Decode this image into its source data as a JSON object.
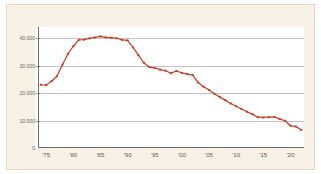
{
  "chart_data": {
    "type": "line",
    "title": "",
    "subtitle": "",
    "xlabel": "",
    "ylabel": "",
    "grid": "horizontal",
    "legend": "none",
    "xlim": [
      1973.5,
      2022.5
    ],
    "ylim": [
      0,
      44000
    ],
    "y_ticks": [
      0,
      10000,
      20000,
      30000,
      40000
    ],
    "y_tick_labels": [
      "0",
      "10.000",
      "20.000",
      "30.000",
      "40.000"
    ],
    "x_ticks": [
      1975,
      1980,
      1985,
      1990,
      1995,
      2000,
      2005,
      2010,
      2015,
      2020
    ],
    "x_tick_labels": [
      "'75",
      "'80",
      "'85",
      "'90",
      "'95",
      "'00",
      "'05",
      "'10",
      "'15",
      "'20"
    ],
    "series": [
      {
        "name": "series-1",
        "color": "#C4402B",
        "marker": "square",
        "x": [
          1974,
          1975,
          1976,
          1977,
          1978,
          1979,
          1980,
          1981,
          1982,
          1983,
          1984,
          1985,
          1986,
          1987,
          1988,
          1989,
          1990,
          1991,
          1992,
          1993,
          1994,
          1995,
          1996,
          1997,
          1998,
          1999,
          2000,
          2001,
          2002,
          2003,
          2004,
          2005,
          2006,
          2007,
          2008,
          2009,
          2010,
          2011,
          2012,
          2013,
          2014,
          2015,
          2016,
          2017,
          2018,
          2019,
          2020,
          2021,
          2022
        ],
        "values": [
          23000,
          22900,
          24300,
          26100,
          30300,
          34200,
          37000,
          39300,
          39400,
          39900,
          40200,
          40600,
          40200,
          40100,
          39900,
          39300,
          39100,
          36600,
          33800,
          31000,
          29400,
          29100,
          28500,
          28100,
          27200,
          28000,
          27300,
          26900,
          26500,
          23800,
          22300,
          21100,
          19700,
          18500,
          17400,
          16200,
          15200,
          14200,
          13200,
          12300,
          11200,
          11100,
          11200,
          11300,
          10600,
          9900,
          8100,
          7800,
          6600
        ]
      }
    ]
  }
}
